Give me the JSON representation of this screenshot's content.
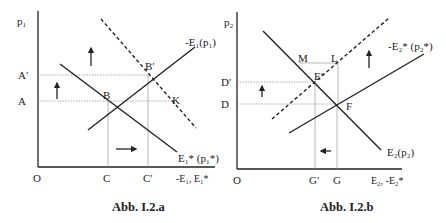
{
  "figures": [
    {
      "caption": "Abb. I.2.a",
      "y_axis_label": "p₁",
      "x_axis_label": "-E₁, E₁*",
      "origin_label": "O",
      "y_ticks": [
        {
          "label": "A′",
          "y": 75
        },
        {
          "label": "A",
          "y": 101
        }
      ],
      "x_ticks": [
        {
          "label": "C",
          "x": 108
        },
        {
          "label": "C′",
          "x": 148
        }
      ],
      "curves": [
        {
          "label": "-E₁(p₁)",
          "style": "solid"
        },
        {
          "label": "E₁* (p₁*)",
          "style": "solid"
        },
        {
          "label": "",
          "style": "dashed"
        }
      ],
      "points": [
        {
          "label": "B"
        },
        {
          "label": "B′"
        },
        {
          "label": "K"
        }
      ],
      "arrows": [
        "up",
        "up",
        "right"
      ]
    },
    {
      "caption": "Abb. I.2.b",
      "y_axis_label": "p₂",
      "x_axis_label": "E₂, -E₂*",
      "origin_label": "O",
      "y_ticks": [
        {
          "label": "D′",
          "y": 82
        },
        {
          "label": "D",
          "y": 104
        }
      ],
      "x_ticks": [
        {
          "label": "G′",
          "x": 315
        },
        {
          "label": "G",
          "x": 337
        }
      ],
      "curves": [
        {
          "label": "-E₂* (p₂*)",
          "style": "solid"
        },
        {
          "label": "E₂(p₂)",
          "style": "solid"
        },
        {
          "label": "",
          "style": "dashed"
        }
      ],
      "points": [
        {
          "label": "M"
        },
        {
          "label": "L"
        },
        {
          "label": "E′"
        },
        {
          "label": "F"
        }
      ],
      "arrows": [
        "up",
        "up",
        "left"
      ]
    }
  ]
}
